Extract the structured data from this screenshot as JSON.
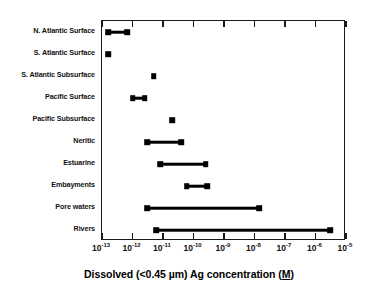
{
  "chart_data": {
    "type": "bar",
    "orientation": "horizontal",
    "title": "",
    "xlabel": "Dissolved (<0.45 µm)  Ag concentration (M)",
    "xlabel_parts": {
      "pre": "Dissolved (<0.45 µm)  Ag concentration (",
      "underlined": "M",
      "post": ")"
    },
    "ylabel": "",
    "xscale": "log",
    "xlim": [
      1e-13,
      1e-05
    ],
    "grid": false,
    "legend": false,
    "xtick_labels": [
      "10⁻¹³",
      "10⁻¹²",
      "10⁻¹¹",
      "10⁻¹⁰",
      "10⁻⁹",
      "10⁻⁸",
      "10⁻⁷",
      "10⁻⁶",
      "10⁻⁵"
    ],
    "xtick_mantissa": "10",
    "xtick_exponents": [
      "-13",
      "-12",
      "-11",
      "-10",
      "-9",
      "-8",
      "-7",
      "-6",
      "-5"
    ],
    "xticks": [
      1e-13,
      1e-12,
      1e-11,
      1e-10,
      1e-09,
      1e-08,
      1e-07,
      1e-06,
      1e-05
    ],
    "categories": [
      "N. Atlantic Surface",
      "S. Atlantic Surface",
      "S. Atlantic Subsurface",
      "Pacific Surface",
      "Pacific Subsurface",
      "Neritic",
      "Estuarine",
      "Embayments",
      "Pore waters",
      "Rivers"
    ],
    "ranges": [
      {
        "category": "N. Atlantic Surface",
        "low": 1.6e-13,
        "high": 6.6e-13
      },
      {
        "category": "S. Atlantic Surface",
        "low": 1.6e-13,
        "high": 1.6e-13
      },
      {
        "category": "S. Atlantic Subsurface",
        "low": 5e-12,
        "high": 5e-12
      },
      {
        "category": "Pacific Surface",
        "low": 1e-12,
        "high": 2.5e-12
      },
      {
        "category": "Pacific Subsurface",
        "low": 2e-11,
        "high": 2e-11
      },
      {
        "category": "Neritic",
        "low": 3e-12,
        "high": 4e-11
      },
      {
        "category": "Estuarine",
        "low": 8e-12,
        "high": 2.5e-10
      },
      {
        "category": "Embayments",
        "low": 6e-11,
        "high": 2.8e-10
      },
      {
        "category": "Pore waters",
        "low": 3e-12,
        "high": 1.4e-08
      },
      {
        "category": "Rivers",
        "low": 6e-12,
        "high": 3e-06
      }
    ],
    "colors": {
      "marker": "#000000",
      "line": "#000000",
      "axis": "#1a1a1a",
      "background": "#ffffff"
    }
  }
}
